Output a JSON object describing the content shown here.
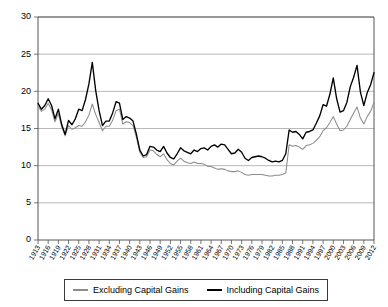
{
  "chart_data": {
    "type": "line",
    "title": "",
    "xlabel": "",
    "ylabel": "",
    "ylim": [
      0,
      30
    ],
    "yticks": [
      0,
      5,
      10,
      15,
      20,
      25,
      30
    ],
    "grid": true,
    "legend_position": "bottom",
    "xlim": [
      1913,
      2012
    ],
    "xtick_labels": [
      "1913",
      "1916",
      "1919",
      "1922",
      "1925",
      "1928",
      "1931",
      "1934",
      "1937",
      "1940",
      "1943",
      "1946",
      "1949",
      "1952",
      "1955",
      "1958",
      "1961",
      "1964",
      "1967",
      "1970",
      "1973",
      "1976",
      "1979",
      "1982",
      "1985",
      "1988",
      "1991",
      "1994",
      "1997",
      "2000",
      "2003",
      "2006",
      "2009",
      "2012"
    ],
    "x": [
      1913,
      1914,
      1915,
      1916,
      1917,
      1918,
      1919,
      1920,
      1921,
      1922,
      1923,
      1924,
      1925,
      1926,
      1927,
      1928,
      1929,
      1930,
      1931,
      1932,
      1933,
      1934,
      1935,
      1936,
      1937,
      1938,
      1939,
      1940,
      1941,
      1942,
      1943,
      1944,
      1945,
      1946,
      1947,
      1948,
      1949,
      1950,
      1951,
      1952,
      1953,
      1954,
      1955,
      1956,
      1957,
      1958,
      1959,
      1960,
      1961,
      1962,
      1963,
      1964,
      1965,
      1966,
      1967,
      1968,
      1969,
      1970,
      1971,
      1972,
      1973,
      1974,
      1975,
      1976,
      1977,
      1978,
      1979,
      1980,
      1981,
      1982,
      1983,
      1984,
      1985,
      1986,
      1987,
      1988,
      1989,
      1990,
      1991,
      1992,
      1993,
      1994,
      1995,
      1996,
      1997,
      1998,
      1999,
      2000,
      2001,
      2002,
      2003,
      2004,
      2005,
      2006,
      2007,
      2008,
      2009,
      2010,
      2011,
      2012
    ],
    "series": [
      {
        "name": "Including Capital Gains",
        "color": "#000000",
        "values": [
          18.4,
          17.6,
          18.1,
          19.0,
          18.1,
          16.3,
          17.6,
          15.5,
          14.2,
          16.1,
          15.5,
          16.3,
          17.6,
          17.4,
          18.9,
          21.0,
          23.9,
          20.1,
          17.4,
          15.4,
          16.0,
          16.0,
          17.1,
          18.6,
          18.4,
          16.2,
          16.6,
          16.4,
          16.0,
          14.2,
          12.1,
          11.3,
          11.5,
          12.6,
          12.5,
          12.1,
          11.9,
          12.6,
          11.7,
          11.1,
          10.9,
          11.6,
          12.4,
          12.0,
          11.8,
          11.6,
          12.1,
          11.9,
          12.3,
          12.4,
          12.1,
          12.6,
          12.8,
          12.5,
          12.9,
          12.8,
          12.2,
          11.6,
          11.7,
          12.2,
          11.8,
          11.0,
          10.7,
          11.1,
          11.2,
          11.3,
          11.2,
          11.0,
          10.7,
          10.5,
          10.6,
          10.5,
          10.7,
          11.6,
          14.8,
          14.5,
          14.6,
          14.2,
          13.6,
          14.5,
          14.6,
          14.8,
          15.7,
          16.7,
          18.2,
          18.0,
          19.6,
          21.8,
          19.0,
          17.2,
          17.4,
          18.5,
          20.6,
          21.9,
          23.5,
          19.9,
          18.1,
          19.8,
          20.9,
          22.5
        ]
      },
      {
        "name": "Excluding Capital Gains",
        "color": "#8c8c8c",
        "values": [
          18.1,
          17.3,
          17.6,
          18.4,
          17.5,
          15.9,
          17.0,
          15.2,
          14.0,
          15.4,
          14.9,
          15.1,
          15.4,
          15.3,
          15.9,
          16.8,
          18.3,
          16.9,
          15.8,
          14.7,
          15.3,
          15.3,
          16.1,
          17.4,
          17.6,
          15.6,
          15.9,
          15.8,
          15.4,
          13.8,
          11.8,
          11.1,
          11.2,
          12.1,
          12.0,
          11.5,
          11.2,
          11.6,
          10.8,
          10.3,
          10.1,
          10.6,
          11.0,
          10.6,
          10.4,
          10.3,
          10.5,
          10.3,
          10.3,
          10.2,
          9.9,
          9.9,
          9.7,
          9.5,
          9.6,
          9.5,
          9.3,
          9.2,
          9.2,
          9.3,
          9.1,
          8.8,
          8.7,
          8.8,
          8.8,
          8.8,
          8.8,
          8.7,
          8.6,
          8.6,
          8.7,
          8.7,
          8.8,
          9.0,
          12.8,
          12.6,
          12.7,
          12.5,
          12.2,
          12.7,
          12.8,
          13.0,
          13.4,
          13.9,
          14.7,
          15.1,
          15.8,
          16.6,
          15.6,
          14.7,
          14.8,
          15.3,
          16.2,
          17.1,
          17.9,
          16.4,
          15.6,
          16.6,
          17.3,
          18.5
        ]
      }
    ]
  },
  "legend": {
    "entries": [
      {
        "label": "Excluding Capital Gains",
        "marker": "line-swatch-gray"
      },
      {
        "label": "Including Capital Gains",
        "marker": "line-swatch-black"
      }
    ]
  }
}
